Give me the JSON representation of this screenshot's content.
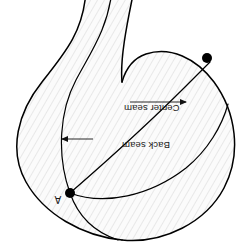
{
  "figure": {
    "name": "garment-pattern-piece",
    "orientation_degrees": 180,
    "background_color": "#ffffff",
    "line_color": "#000000",
    "fill_color": "#fbfbfb",
    "hatch_color": "#e2e2e2"
  },
  "labels": {
    "center_seam": "Center seam",
    "back_seam": "Back seam",
    "point_a": "A"
  },
  "markers": [
    {
      "id": "dot-upper-right",
      "label": "",
      "x": 207,
      "y": 58
    },
    {
      "id": "dot-point-a",
      "label": "A",
      "x": 70,
      "y": 193
    }
  ],
  "annotations": [
    {
      "id": "center-seam-annotation",
      "text": "Center seam",
      "arrow_direction": "right",
      "text_x": 124,
      "text_y": 105,
      "arrow_from_x": 152,
      "arrow_to_x": 192,
      "arrow_y": 105
    },
    {
      "id": "back-seam-annotation",
      "text": "Back seam",
      "arrow_direction": "left",
      "text_x": 122,
      "text_y": 142,
      "arrow_from_x": 93,
      "arrow_to_x": 61,
      "arrow_y": 142
    }
  ]
}
